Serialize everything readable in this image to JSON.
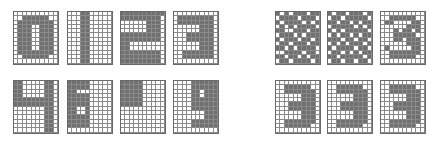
{
  "figure": {
    "grid_cols": 10,
    "grid_rows": 12,
    "on_color": "#707070",
    "off_color": "#ffffff",
    "line_color": "#8a8a8a"
  },
  "left_panel": {
    "description": "Clean digit bitmaps",
    "grids": [
      {
        "label": "0",
        "x": 13,
        "y": 11,
        "bits": [
          "0000000000",
          "0011111100",
          "0111111110",
          "0111001110",
          "0111001110",
          "0111001110",
          "0111001110",
          "0111001110",
          "0111001110",
          "0111111110",
          "0011111100",
          "0000000000"
        ]
      },
      {
        "label": "1",
        "x": 67,
        "y": 11,
        "bits": [
          "0001100000",
          "0001100000",
          "0001100000",
          "0001100000",
          "0001100000",
          "0001100000",
          "0001100000",
          "0001100000",
          "0001100000",
          "0001100000",
          "0001100000",
          "0001100000"
        ]
      },
      {
        "label": "2",
        "x": 120,
        "y": 11,
        "bits": [
          "1111111111",
          "1111111110",
          "0000001110",
          "0000001110",
          "0000001110",
          "1111111110",
          "1111111110",
          "1100000000",
          "1100000000",
          "1111111110",
          "1111111110",
          "1111111110"
        ]
      },
      {
        "label": "3",
        "x": 173,
        "y": 11,
        "bits": [
          "0000000000",
          "0111111110",
          "0111111110",
          "0000001110",
          "0000001110",
          "0001111110",
          "0001111110",
          "0000001110",
          "0000001110",
          "0011111110",
          "0011111110",
          "0000000000"
        ]
      },
      {
        "label": "4",
        "x": 13,
        "y": 80,
        "bits": [
          "1100000110",
          "1100000110",
          "1100000110",
          "1100000110",
          "1111111110",
          "1111111110",
          "0000000110",
          "0000000110",
          "0000000110",
          "0000000110",
          "0000000110",
          "0000000110"
        ]
      },
      {
        "label": "6",
        "x": 67,
        "y": 80,
        "bits": [
          "1111100000",
          "1111100000",
          "1100000000",
          "1111100000",
          "1111100000",
          "1111100000",
          "1100100000",
          "1100100000",
          "1111100000",
          "1111100000",
          "1111100000",
          "0000000000"
        ]
      },
      {
        "label": "partial-block",
        "x": 120,
        "y": 80,
        "bits": [
          "1111100000",
          "1111100000",
          "1111100000",
          "1111100000",
          "1111100000",
          "1111100000",
          "0000000000",
          "0000000000",
          "0000000000",
          "0000000000",
          "0000000000",
          "0000000000"
        ]
      },
      {
        "label": "9",
        "x": 173,
        "y": 80,
        "bits": [
          "0000111111",
          "0000111111",
          "0000110111",
          "0000110111",
          "0000111111",
          "0000111111",
          "0000111111",
          "0000000111",
          "0000000111",
          "0000111111",
          "0000111111",
          "0000000000"
        ]
      }
    ]
  },
  "right_panel": {
    "description": "Noisy / distorted versions of digit 3",
    "grids": [
      {
        "label": "3-noisy-a",
        "x": 275,
        "y": 11,
        "bits": [
          "1010111011",
          "0111101110",
          "1011110101",
          "0101011110",
          "1100111011",
          "0111010111",
          "1011101101",
          "0110111011",
          "1101011110",
          "0011110110",
          "1101101011",
          "0110111101"
        ]
      },
      {
        "label": "3-noisy-b",
        "x": 327,
        "y": 11,
        "bits": [
          "1011011101",
          "0110111110",
          "1101101011",
          "0111110101",
          "1010111110",
          "0101101011",
          "1110110110",
          "0101011101",
          "1011110110",
          "0110101011",
          "1101111101",
          "0110110110"
        ]
      },
      {
        "label": "3-noisy-c",
        "x": 380,
        "y": 11,
        "bits": [
          "0000000000",
          "0011111100",
          "0110000110",
          "0000001110",
          "0001011010",
          "0001111100",
          "0001101110",
          "0000001110",
          "0100000110",
          "0011111110",
          "0011111100",
          "0000000000"
        ]
      },
      {
        "label": "3-recalled-a",
        "x": 275,
        "y": 80,
        "bits": [
          "0000000000",
          "0011111100",
          "0011111110",
          "0000001110",
          "0000001110",
          "0001111110",
          "0001111110",
          "0000001110",
          "0000001110",
          "0011111110",
          "0011111100",
          "0000000000"
        ]
      },
      {
        "label": "3-recalled-b",
        "x": 327,
        "y": 80,
        "bits": [
          "0000000000",
          "0011111100",
          "0011111110",
          "0000001110",
          "0000001110",
          "0001111110",
          "0001111110",
          "0000001110",
          "0000001110",
          "0011111110",
          "0011111100",
          "0000000000"
        ]
      },
      {
        "label": "3-recalled-c",
        "x": 380,
        "y": 80,
        "bits": [
          "0000000000",
          "0011111100",
          "0011111110",
          "0000001110",
          "0000001110",
          "0001111110",
          "0001111110",
          "0000001110",
          "0000001110",
          "0011111110",
          "0011111100",
          "0000000000"
        ]
      }
    ]
  }
}
